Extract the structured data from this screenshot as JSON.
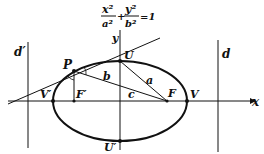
{
  "equation": {
    "x_term_num": "x²",
    "x_term_den": "a²",
    "plus": "+",
    "y_term_num": "y²",
    "y_term_den": "b²",
    "equals": "=1"
  },
  "labels": {
    "y_axis": "y",
    "x_axis": "x",
    "directrix_left": "d′",
    "directrix_right": "d",
    "point_P": "P",
    "vertex_top": "U",
    "vertex_bottom": "U′",
    "vertex_left": "V′",
    "vertex_right": "V",
    "focus_left": "F′",
    "focus_right": "F",
    "seg_a": "a",
    "seg_b": "b",
    "seg_c": "c"
  },
  "colors": {
    "ink": "#111111",
    "background": "#ffffff"
  }
}
